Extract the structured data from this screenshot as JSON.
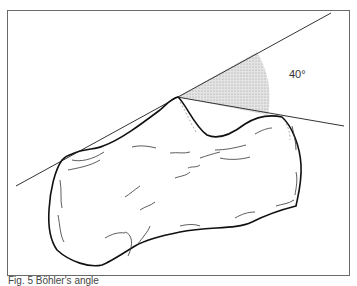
{
  "figure": {
    "angle_label": "40°",
    "caption": "Fig. 5  Böhler's angle"
  },
  "colors": {
    "line": "#222222",
    "frame": "#6a6a6a",
    "shading": "#c8c8c8"
  }
}
